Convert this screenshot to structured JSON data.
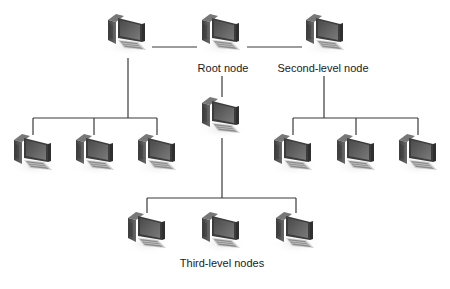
{
  "diagram": {
    "labels": {
      "root": "Root node",
      "second_level": "Second-level node",
      "third_level": "Third-level nodes"
    },
    "colors": {
      "line": "#3a3a3a",
      "tower": "#4e4e4e",
      "monitor": "#5a5a5a",
      "keyboard": "#9a9a9a",
      "background": "#ffffff"
    },
    "nodes": [
      {
        "id": "root",
        "level": "root",
        "icon": "computer-icon",
        "x": 222,
        "y": 32
      },
      {
        "id": "second-left",
        "level": "second",
        "icon": "computer-icon",
        "x": 128,
        "y": 32
      },
      {
        "id": "second-right",
        "level": "second",
        "icon": "computer-icon",
        "x": 326,
        "y": 32
      },
      {
        "id": "second-mid",
        "level": "second",
        "icon": "computer-icon",
        "x": 222,
        "y": 115
      },
      {
        "id": "leaf-l1",
        "level": "third",
        "icon": "computer-icon",
        "x": 34,
        "y": 152
      },
      {
        "id": "leaf-l2",
        "level": "third",
        "icon": "computer-icon",
        "x": 96,
        "y": 152
      },
      {
        "id": "leaf-l3",
        "level": "third",
        "icon": "computer-icon",
        "x": 158,
        "y": 152
      },
      {
        "id": "leaf-r1",
        "level": "third",
        "icon": "computer-icon",
        "x": 294,
        "y": 152
      },
      {
        "id": "leaf-r2",
        "level": "third",
        "icon": "computer-icon",
        "x": 357,
        "y": 152
      },
      {
        "id": "leaf-r3",
        "level": "third",
        "icon": "computer-icon",
        "x": 419,
        "y": 152
      },
      {
        "id": "leaf-m1",
        "level": "third",
        "icon": "computer-icon",
        "x": 148,
        "y": 230
      },
      {
        "id": "leaf-m2",
        "level": "third",
        "icon": "computer-icon",
        "x": 222,
        "y": 230
      },
      {
        "id": "leaf-m3",
        "level": "third",
        "icon": "computer-icon",
        "x": 296,
        "y": 230
      }
    ]
  }
}
